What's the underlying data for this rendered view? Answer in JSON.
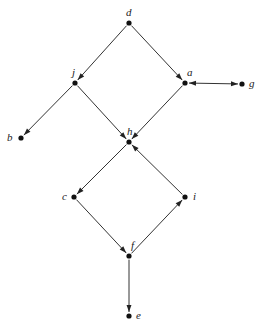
{
  "diagram": {
    "type": "directed-graph",
    "colors": {
      "edge": "#333333",
      "node": "#111111",
      "label": "#222222",
      "background": "#ffffff"
    },
    "nodes": [
      {
        "id": "d",
        "label": "d",
        "x": 129,
        "y": 23,
        "label_dx": -3,
        "label_dy": -16
      },
      {
        "id": "j",
        "label": "j",
        "x": 75,
        "y": 83,
        "label_dx": -3,
        "label_dy": -16
      },
      {
        "id": "a",
        "label": "a",
        "x": 185,
        "y": 83,
        "label_dx": 2,
        "label_dy": -16
      },
      {
        "id": "g",
        "label": "g",
        "x": 242,
        "y": 84,
        "label_dx": 7,
        "label_dy": -6
      },
      {
        "id": "b",
        "label": "b",
        "x": 21,
        "y": 138,
        "label_dx": -14,
        "label_dy": -6
      },
      {
        "id": "h",
        "label": "h",
        "x": 129,
        "y": 142,
        "label_dx": -2,
        "label_dy": -16
      },
      {
        "id": "c",
        "label": "c",
        "x": 74,
        "y": 197,
        "label_dx": -12,
        "label_dy": -6
      },
      {
        "id": "i",
        "label": "i",
        "x": 185,
        "y": 197,
        "label_dx": 8,
        "label_dy": -6
      },
      {
        "id": "f",
        "label": "f",
        "x": 129,
        "y": 256,
        "label_dx": 2,
        "label_dy": -16
      },
      {
        "id": "e",
        "label": "e",
        "x": 129,
        "y": 316,
        "label_dx": 7,
        "label_dy": -6
      }
    ],
    "edges": [
      {
        "from": "d",
        "to": "j",
        "arrow": "end"
      },
      {
        "from": "d",
        "to": "a",
        "arrow": "end"
      },
      {
        "from": "j",
        "to": "b",
        "arrow": "end"
      },
      {
        "from": "j",
        "to": "h",
        "arrow": "end"
      },
      {
        "from": "a",
        "to": "h",
        "arrow": "end"
      },
      {
        "from": "a",
        "to": "g",
        "arrow": "both"
      },
      {
        "from": "h",
        "to": "c",
        "arrow": "end"
      },
      {
        "from": "c",
        "to": "f",
        "arrow": "end"
      },
      {
        "from": "f",
        "to": "i",
        "arrow": "end"
      },
      {
        "from": "i",
        "to": "h",
        "arrow": "end"
      },
      {
        "from": "f",
        "to": "e",
        "arrow": "end"
      }
    ]
  }
}
